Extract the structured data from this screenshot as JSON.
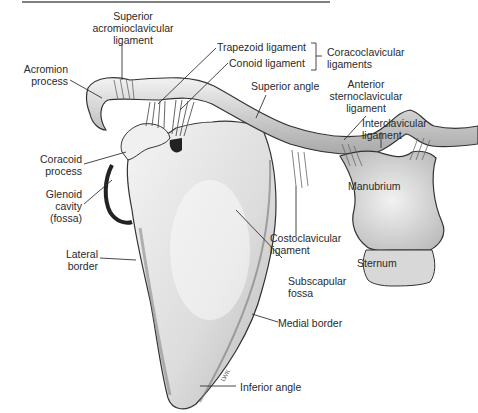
{
  "figure": {
    "type": "anatomical-illustration",
    "signature": "LWK"
  },
  "labels": {
    "superior_acromioclavicular": [
      "Superior",
      "acromioclavicular",
      "ligament"
    ],
    "acromion_process": [
      "Acromion",
      "process"
    ],
    "trapezoid_ligament": "Trapezoid ligament",
    "conoid_ligament": "Conoid ligament",
    "coracoclavicular_ligaments": [
      "Coracoclavicular",
      "ligaments"
    ],
    "superior_angle": "Superior angle",
    "anterior_sternoclavicular": [
      "Anterior",
      "sternoclavicular",
      "ligament"
    ],
    "interclavicular_ligament": [
      "Interclavicular",
      "ligament"
    ],
    "coracoid_process": [
      "Coracoid",
      "process"
    ],
    "glenoid_cavity": [
      "Glenoid",
      "cavity",
      "(fossa)"
    ],
    "manubrium": "Manubrium",
    "lateral_border": [
      "Lateral",
      "border"
    ],
    "costoclavicular_ligament": [
      "Costoclavicular",
      "ligament"
    ],
    "subscapular_fossa": [
      "Subscapular",
      "fossa"
    ],
    "sternum": "Sternum",
    "medial_border": "Medial border",
    "inferior_angle": "Inferior angle"
  },
  "colors": {
    "bone_fill": "#e6e6e6",
    "bone_shade": "#9a9a9a",
    "outline": "#333333",
    "leader_line": "#333333",
    "top_rule": "#555555"
  }
}
